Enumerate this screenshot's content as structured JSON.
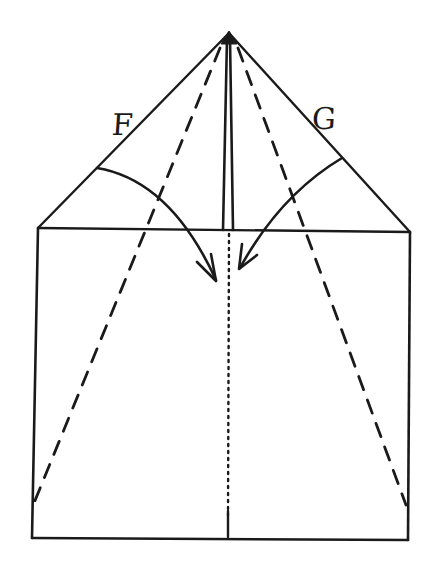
{
  "diagram": {
    "type": "origami-fold-instruction",
    "labels": {
      "left_flap": "F",
      "right_flap": "G"
    },
    "colors": {
      "ink": "#1a1a1a",
      "paper": "#ffffff"
    },
    "elements": {
      "outline": "square with triangular top (house shape)",
      "center_crease": "double solid line from apex to base of triangle",
      "center_line_lower": "dotted vertical line through square",
      "valley_folds": "two dashed lines from apex to lower side edges",
      "fold_arrows": [
        {
          "label": "F",
          "direction": "fold left flap toward center"
        },
        {
          "label": "G",
          "direction": "fold right flap toward center"
        }
      ]
    }
  }
}
